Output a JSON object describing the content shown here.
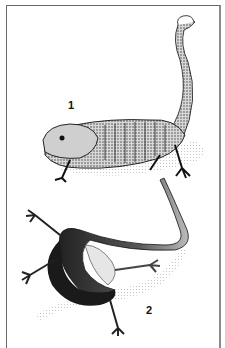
{
  "figure": {
    "labels": [
      {
        "id": "1",
        "text": "1"
      },
      {
        "id": "2",
        "text": "2"
      }
    ],
    "subjects": [
      {
        "id": "1",
        "description": "stippled lizard-like amphibian, walking pose, tail raised and curled"
      },
      {
        "id": "2",
        "description": "dark slender salamander, dorsal view, body coiled in S-curve"
      }
    ],
    "colors": {
      "ink": "#111111",
      "paper": "#ffffff",
      "border": "#6a6a6a"
    }
  }
}
